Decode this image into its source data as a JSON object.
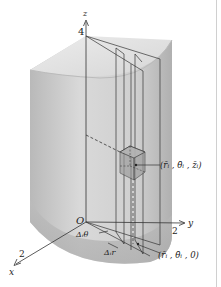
{
  "figure": {
    "type": "cylindrical-coordinates-volume-element",
    "axes": {
      "z": {
        "label": "z",
        "tick": "4"
      },
      "y": {
        "label": "y",
        "tick": "2"
      },
      "x": {
        "label": "x",
        "tick": "2"
      },
      "origin": "O"
    },
    "annotations": {
      "point_upper": "(r̄ᵢ , θ̄ᵢ , z̄ᵢ)",
      "point_lower": "(r̄ᵢ , θ̄ᵢ , 0)",
      "delta_theta": "Δᵢθ",
      "delta_r": "Δᵢr"
    },
    "colors": {
      "solid_light": "#e6e6e6",
      "solid_mid": "#c4c4c4",
      "solid_dark": "#a8a8a8",
      "line": "#333333",
      "box_fill": "#9a9a9a"
    }
  }
}
